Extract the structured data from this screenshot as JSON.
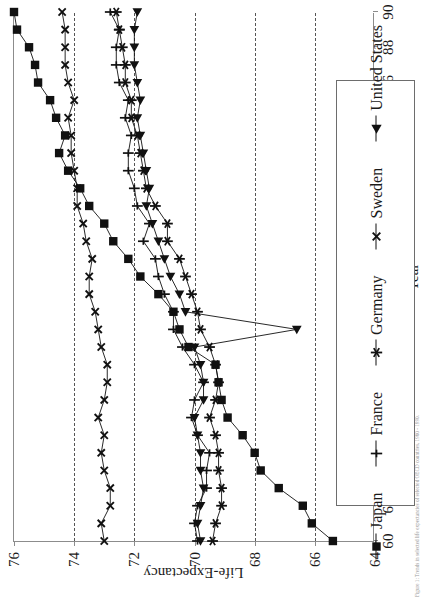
{
  "chart_data": {
    "type": "line",
    "title": "",
    "xlabel": "Year",
    "ylabel": "Life-Expectancy",
    "xlim": [
      60,
      90
    ],
    "ylim": [
      64,
      76
    ],
    "xticks": [
      60,
      62,
      64,
      66,
      68,
      70,
      72,
      74,
      76,
      78,
      80,
      82,
      84,
      86,
      88,
      90
    ],
    "yticks": [
      64,
      66,
      68,
      70,
      72,
      74,
      76
    ],
    "gridlines_y": [
      66,
      68,
      70,
      72,
      74
    ],
    "grid": "horizontal-dashed",
    "legend_position": "right",
    "x": [
      60,
      61,
      62,
      63,
      64,
      65,
      66,
      67,
      68,
      69,
      70,
      71,
      72,
      73,
      74,
      75,
      76,
      77,
      78,
      79,
      80,
      81,
      82,
      83,
      84,
      85,
      86,
      87,
      88,
      89,
      90
    ],
    "series": [
      {
        "name": "Japan",
        "marker": "filled-square",
        "values": [
          65.4,
          66.1,
          66.4,
          67.2,
          67.8,
          68.0,
          68.4,
          68.9,
          69.1,
          69.2,
          69.3,
          70.2,
          70.5,
          70.7,
          71.2,
          71.8,
          72.2,
          72.7,
          73.0,
          73.5,
          73.8,
          74.2,
          74.5,
          74.3,
          74.6,
          74.8,
          75.2,
          75.3,
          75.5,
          75.9,
          76.0
        ]
      },
      {
        "name": "France",
        "marker": "plus",
        "values": [
          69.9,
          70.0,
          69.9,
          69.6,
          69.6,
          69.5,
          69.9,
          70.1,
          70.0,
          69.7,
          70.0,
          70.4,
          70.7,
          70.7,
          71.0,
          71.2,
          71.3,
          71.7,
          71.5,
          71.9,
          72.0,
          72.2,
          72.2,
          72.1,
          72.3,
          72.2,
          72.5,
          72.6,
          72.6,
          72.5,
          72.8
        ]
      },
      {
        "name": "Germany",
        "marker": "asterisk",
        "values": [
          69.4,
          69.3,
          69.1,
          69.1,
          69.2,
          69.2,
          69.3,
          69.5,
          69.3,
          69.2,
          69.3,
          69.5,
          69.8,
          69.9,
          70.1,
          70.3,
          70.5,
          70.9,
          70.9,
          71.3,
          71.6,
          71.7,
          71.8,
          71.9,
          72.1,
          72.1,
          72.3,
          72.3,
          72.4,
          72.5,
          72.6
        ]
      },
      {
        "name": "Sweden",
        "marker": "x",
        "values": [
          73.0,
          73.1,
          72.8,
          72.8,
          73.0,
          73.1,
          73.0,
          73.2,
          73.0,
          72.9,
          72.9,
          73.1,
          73.2,
          73.3,
          73.5,
          73.5,
          73.4,
          73.6,
          73.7,
          73.9,
          73.9,
          74.0,
          74.1,
          74.1,
          74.2,
          74.0,
          74.2,
          74.3,
          74.3,
          74.3,
          74.4
        ]
      },
      {
        "name": "United States",
        "marker": "filled-triangle",
        "values": [
          69.8,
          69.9,
          69.8,
          69.7,
          69.8,
          69.8,
          69.9,
          70.0,
          69.7,
          69.7,
          69.8,
          70.0,
          66.6,
          70.3,
          70.5,
          70.8,
          71.0,
          71.2,
          71.4,
          71.6,
          71.5,
          71.6,
          71.7,
          71.8,
          71.9,
          71.8,
          71.9,
          72.0,
          72.0,
          72.0,
          71.9
        ]
      }
    ]
  },
  "legend": {
    "items": [
      {
        "label": "Japan",
        "marker": "filled-square"
      },
      {
        "label": "France",
        "marker": "plus"
      },
      {
        "label": "Germany",
        "marker": "asterisk"
      },
      {
        "label": "Sweden",
        "marker": "x"
      },
      {
        "label": "United States",
        "marker": "filled-triangle"
      }
    ]
  },
  "caption": {
    "line1": "Figure 1: Trends in selected life expectancies of selected OECD countries, 1960 - 1990."
  }
}
